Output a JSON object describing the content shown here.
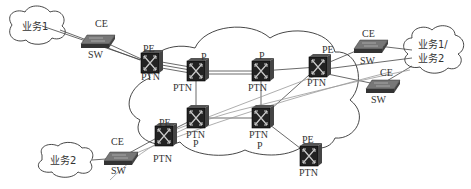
{
  "diagram": {
    "type": "PTN network topology",
    "clouds": [
      {
        "id": "service1",
        "label": "业务1"
      },
      {
        "id": "service12",
        "label_line1": "业务1/",
        "label_line2": "业务2"
      },
      {
        "id": "service2",
        "label": "业务2"
      }
    ],
    "nodes": {
      "pe1": {
        "role": "PE",
        "type": "PTN"
      },
      "p1": {
        "role": "P",
        "type": "PTN"
      },
      "p2": {
        "role": "P",
        "type": "PTN"
      },
      "pe2": {
        "role": "PE",
        "type": "PTN"
      },
      "p3": {
        "role": "P",
        "type": "PTN"
      },
      "p4": {
        "role": "P",
        "type": "PTN"
      },
      "pe3": {
        "role": "PE",
        "type": "PTN"
      },
      "pe4": {
        "role": "PE",
        "type": "PTN"
      }
    },
    "switches": {
      "ce_top_left": {
        "role": "CE",
        "type": "SW"
      },
      "ce_top_right": {
        "role": "CE",
        "type": "SW"
      },
      "ce_mid_right": {
        "role": "CE",
        "type": "SW"
      },
      "ce_bottom_left": {
        "role": "CE",
        "type": "SW"
      }
    },
    "colors": {
      "line": "#444444",
      "light_line": "#888888",
      "device": "#2a2a2a"
    }
  }
}
